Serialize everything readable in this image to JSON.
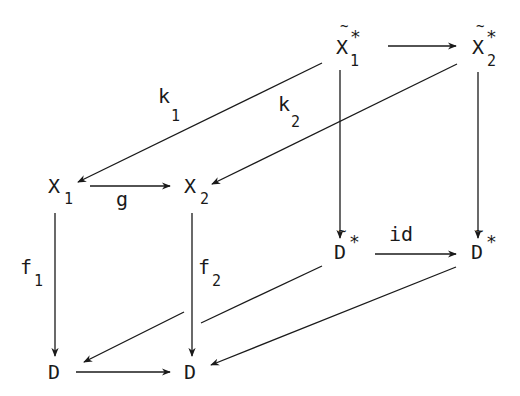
{
  "diagram": {
    "type": "commutative-cube",
    "nodes": {
      "xt1": {
        "base": "X",
        "sub": "1",
        "sup": "*",
        "tilde": "~",
        "label": "X̃₁*"
      },
      "xt2": {
        "base": "X",
        "sub": "2",
        "sup": "*",
        "tilde": "~",
        "label": "X̃₂*"
      },
      "x1": {
        "base": "X",
        "sub": "1",
        "label": "X₁"
      },
      "x2": {
        "base": "X",
        "sub": "2",
        "label": "X₂"
      },
      "dt1": {
        "base": "D",
        "sup": "*",
        "tilde": "~",
        "label": "D̃*"
      },
      "dt2": {
        "base": "D",
        "sup": "*",
        "tilde": "~",
        "label": "D̃*"
      },
      "d1": {
        "base": "D",
        "label": "D"
      },
      "d2": {
        "base": "D",
        "label": "D"
      }
    },
    "edges": {
      "top": {
        "from": "xt1",
        "to": "xt2",
        "label": ""
      },
      "k1": {
        "from": "xt1",
        "to": "x1",
        "label": "k",
        "sub": "1"
      },
      "k2": {
        "from": "xt2",
        "to": "x2",
        "label": "k",
        "sub": "2"
      },
      "g": {
        "from": "x1",
        "to": "x2",
        "label": "g"
      },
      "left_back": {
        "from": "xt1",
        "to": "dt1",
        "label": ""
      },
      "right_back": {
        "from": "xt2",
        "to": "dt2",
        "label": ""
      },
      "id": {
        "from": "dt1",
        "to": "dt2",
        "label": "id"
      },
      "f1": {
        "from": "x1",
        "to": "d1",
        "label": "f",
        "sub": "1"
      },
      "f2": {
        "from": "x2",
        "to": "d2",
        "label": "f",
        "sub": "2"
      },
      "dt1_d1": {
        "from": "dt1",
        "to": "d1",
        "label": ""
      },
      "dt2_d2": {
        "from": "dt2",
        "to": "d2",
        "label": ""
      },
      "bottom": {
        "from": "d1",
        "to": "d2",
        "label": ""
      }
    }
  }
}
